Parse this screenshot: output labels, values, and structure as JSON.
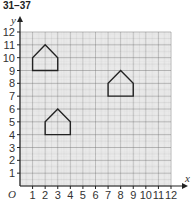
{
  "header": {
    "title": "31–37"
  },
  "chart_data": {
    "type": "scatter",
    "title": "31–37",
    "xlabel": "x",
    "ylabel": "y",
    "origin_label": "O",
    "xlim": [
      0,
      12
    ],
    "ylim": [
      0,
      12
    ],
    "x_ticks": [
      1,
      2,
      3,
      4,
      5,
      6,
      7,
      8,
      9,
      10,
      11,
      12
    ],
    "y_ticks": [
      1,
      2,
      3,
      4,
      5,
      6,
      7,
      8,
      9,
      10,
      11,
      12
    ],
    "grid": true,
    "shapes": [
      {
        "name": "pentagon-A",
        "points": [
          [
            1,
            9
          ],
          [
            1,
            10
          ],
          [
            2,
            11
          ],
          [
            3,
            10
          ],
          [
            3,
            9
          ]
        ]
      },
      {
        "name": "pentagon-B",
        "points": [
          [
            7,
            7
          ],
          [
            7,
            8
          ],
          [
            8,
            9
          ],
          [
            9,
            8
          ],
          [
            9,
            7
          ]
        ]
      },
      {
        "name": "pentagon-C",
        "points": [
          [
            2,
            4
          ],
          [
            2,
            5
          ],
          [
            3,
            6
          ],
          [
            4,
            5
          ],
          [
            4,
            4
          ]
        ]
      }
    ]
  }
}
